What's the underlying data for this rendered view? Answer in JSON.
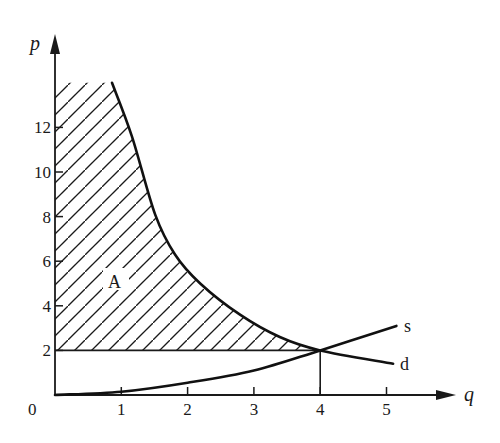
{
  "chart_data": {
    "type": "line",
    "title": "",
    "xlabel": "q",
    "ylabel": "p",
    "xlim": [
      0,
      5.8
    ],
    "ylim": [
      0,
      16
    ],
    "grid": false,
    "x_ticks": [
      "0",
      "1",
      "2",
      "3",
      "4",
      "5"
    ],
    "y_ticks": [
      "2",
      "4",
      "6",
      "8",
      "10",
      "12"
    ],
    "series": [
      {
        "name": "d",
        "label": "d",
        "x": [
          0.86,
          1.16,
          1.51,
          1.81,
          2.19,
          2.79,
          3.39,
          4.0,
          5.1
        ],
        "y": [
          14.0,
          11.6,
          8.1,
          6.3,
          5.0,
          3.6,
          2.6,
          2.0,
          1.4
        ]
      },
      {
        "name": "s",
        "label": "s",
        "x": [
          0,
          1,
          2,
          3,
          4,
          5.15
        ],
        "y": [
          0,
          0.15,
          0.55,
          1.1,
          2.0,
          3.1
        ]
      }
    ],
    "equilibrium": {
      "q": 4,
      "p": 2
    },
    "shaded_region": {
      "label": "A",
      "description": "area under demand curve above p=2, from q=0 to q=4",
      "p_min": 2,
      "p_max": 14
    },
    "annotations": [
      {
        "text": "A",
        "q": 0.9,
        "p": 5.0
      },
      {
        "text": "s",
        "q": 5.3,
        "p": 3.1
      },
      {
        "text": "d",
        "q": 5.3,
        "p": 1.4
      }
    ]
  },
  "labels": {
    "x_axis": "q",
    "y_axis": "p",
    "origin": "0",
    "region": "A",
    "supply": "s",
    "demand": "d"
  }
}
